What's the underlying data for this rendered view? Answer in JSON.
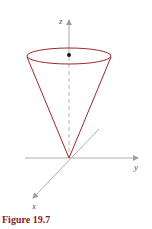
{
  "figure": {
    "caption": "Figure 19.7",
    "axes": {
      "z_label": "z",
      "y_label": "y",
      "x_label": "x"
    },
    "colors": {
      "cone": "#9b2a2a",
      "axis": "#b0b0b0",
      "caption": "#8b1c1c",
      "point": "#111111"
    },
    "shape": "cone",
    "marked_point": "center of top disk"
  }
}
